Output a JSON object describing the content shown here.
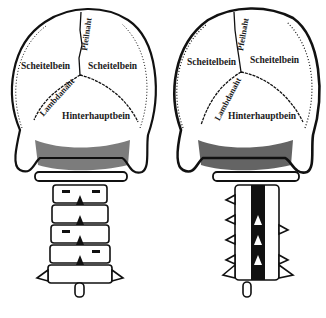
{
  "figure": {
    "colors": {
      "ink": "#111111",
      "paper": "#ffffff"
    },
    "left": {
      "labels": {
        "parietal_left": "Scheitelbein",
        "parietal_right": "Scheitelbein",
        "sagittal_suture": "Pfeilnaht",
        "lambdoid_suture": "Lambdanaht",
        "occipital": "Hinterhauptbein"
      }
    },
    "right": {
      "labels": {
        "parietal_left": "Scheitelbein",
        "parietal_right": "Scheitelbein",
        "sagittal_suture": "Pfeilnaht",
        "lambdoid_suture": "Lambdanaht",
        "occipital": "Hinterhauptbein"
      }
    }
  }
}
